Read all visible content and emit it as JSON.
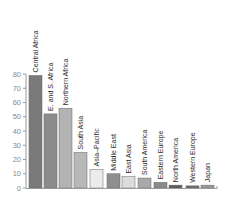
{
  "chart_data": {
    "type": "bar",
    "title": "",
    "xlabel": "",
    "ylabel": "",
    "ylim": [
      0,
      80
    ],
    "yticks": [
      0,
      10,
      20,
      30,
      40,
      50,
      60,
      70,
      80
    ],
    "grid": false,
    "legend": null,
    "categories": [
      "Central Africa",
      "E. and S. Africa",
      "Northern Africa",
      "South Asia",
      "Asia–Pacific",
      "Middle East",
      "East Asia",
      "South America",
      "Eastern Europe",
      "North America",
      "Western Europe",
      "Japan"
    ],
    "values": [
      79,
      52,
      56,
      25,
      13,
      10,
      8,
      7,
      4,
      2,
      1.5,
      2
    ],
    "colors": [
      "#7a7a7a",
      "#8c8c8c",
      "#b3b3b3",
      "#b8b8b8",
      "#ececec",
      "#8f8f8f",
      "#dcdcdc",
      "#a9a9a9",
      "#8a8a8a",
      "#5c5c5c",
      "#6e6e6e",
      "#9a9a9a"
    ],
    "label_placement": "vertical above each bar"
  }
}
